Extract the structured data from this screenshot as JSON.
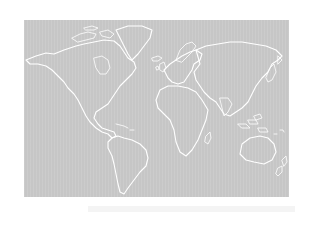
{
  "map": {
    "type": "world-outline-map",
    "background_color": "#c6c6c6",
    "coastline_color": "#ffffff",
    "page_background": "#ffffff",
    "regions": [
      "north-america",
      "greenland",
      "south-america",
      "europe",
      "africa",
      "asia",
      "australia",
      "new-zealand",
      "indonesia"
    ]
  }
}
